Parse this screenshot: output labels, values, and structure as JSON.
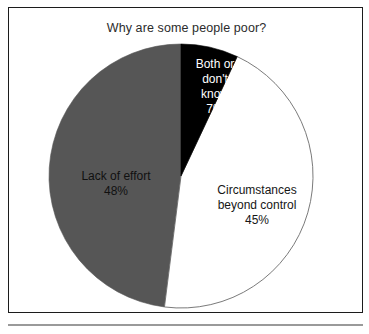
{
  "figure": {
    "title": "Why are some people poor?",
    "frame_color": "#1c1c1c",
    "background": "#ffffff",
    "rule_color": "#9a9a9a"
  },
  "chart_data": {
    "type": "pie",
    "title": "Why are some people poor?",
    "xlabel": "",
    "ylabel": "",
    "legend_position": "none",
    "grid": false,
    "start_angle_deg": 0,
    "direction": "clockwise",
    "categories": [
      "Both or don't know",
      "Circumstances beyond control",
      "Lack of effort"
    ],
    "values": [
      7,
      45,
      48
    ],
    "value_suffix": "%",
    "colors": [
      "#000000",
      "#ffffff",
      "#565656"
    ],
    "slices": [
      {
        "name": "both-or-dont-know",
        "label": "Both or\ndon't\nknow\n7%",
        "label_text": "Both or don't know",
        "value": 7,
        "value_label": "7%",
        "color": "#000000",
        "text_color": "#ffffff",
        "start_deg": 0,
        "end_deg": 25.2
      },
      {
        "name": "circumstances-beyond-control",
        "label": "Circumstances\nbeyond control\n45%",
        "label_text": "Circumstances beyond control",
        "value": 45,
        "value_label": "45%",
        "color": "#ffffff",
        "text_color": "#161616",
        "start_deg": 25.2,
        "end_deg": 187.2
      },
      {
        "name": "lack-of-effort",
        "label": "Lack of effort\n48%",
        "label_text": "Lack of effort",
        "value": 48,
        "value_label": "48%",
        "color": "#565656",
        "text_color": "#111111",
        "start_deg": 187.2,
        "end_deg": 360
      }
    ],
    "geometry": {
      "center_x": 180,
      "center_y": 175,
      "radius": 132,
      "outline_color": "#6b6b6b"
    }
  }
}
